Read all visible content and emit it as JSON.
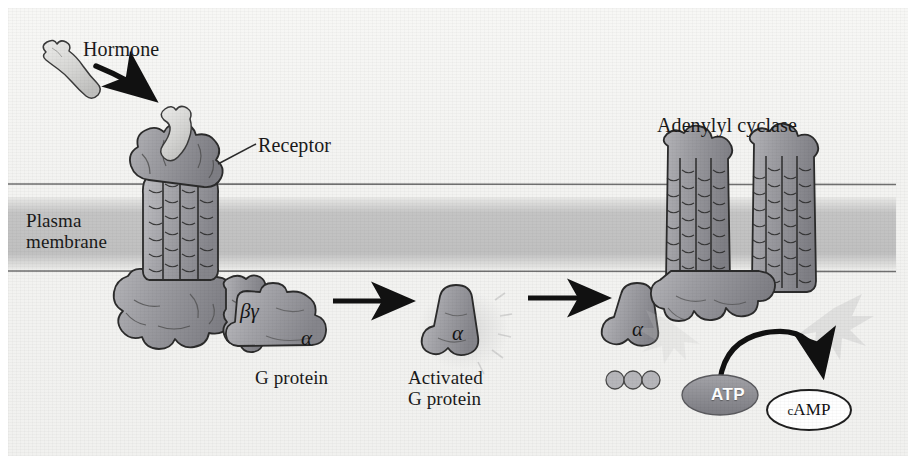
{
  "figure": {
    "domain": "biology-diagram"
  },
  "labels": {
    "hormone": "Hormone",
    "receptor": "Receptor",
    "plasma_membrane": "Plasma\nmembrane",
    "adenylyl_cyclase": "Adenylyl cyclase",
    "g_protein": "G protein",
    "activated_g_protein": "Activated\nG protein",
    "atp": "ATP",
    "camp_c": "c",
    "camp_rest": "AMP",
    "subunit_beta_gamma": "βγ",
    "subunit_alpha_1": "α",
    "subunit_alpha_2": "α",
    "subunit_alpha_3": "α"
  },
  "colors": {
    "background": "#f3f3f1",
    "protein_fill": "#9a9a9e",
    "protein_fill_light": "#c9c9cc",
    "protein_stroke": "#2b2b2b",
    "membrane_band": "#c2c2c2",
    "membrane_line": "#6b6b6b",
    "hormone_fill": "#d8d8d6",
    "atp_fill": "#8e8e92",
    "camp_fill": "#ffffff",
    "arrow": "#111111",
    "text": "#1a1a1a"
  },
  "steps": [
    {
      "index": 1,
      "name": "hormone-binds-receptor",
      "label": "Hormone"
    },
    {
      "index": 2,
      "name": "g-protein-at-receptor",
      "label": "G protein"
    },
    {
      "index": 3,
      "name": "activated-g-protein",
      "label": "Activated G protein"
    },
    {
      "index": 4,
      "name": "adenylyl-cyclase-activation",
      "label": "Adenylyl cyclase"
    },
    {
      "index": 5,
      "name": "atp-to-camp",
      "label": "ATP → cAMP"
    }
  ]
}
